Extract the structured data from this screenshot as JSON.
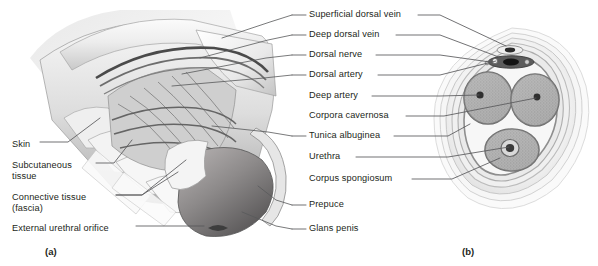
{
  "figure": {
    "type": "anatomical-illustration",
    "style": "grayscale textbook line-and-wash drawing",
    "background_color": "#ffffff",
    "text_color": "#231f20",
    "leader_line_color": "#58595b"
  },
  "panels": [
    {
      "id": "a",
      "caption": "(a)",
      "description": "Cut-away lateral view of the penis shaft with peeled back layers",
      "x": 45,
      "y": 252
    },
    {
      "id": "b",
      "caption": "(b)",
      "description": "Transverse cross-section of the penis shaft",
      "x": 462,
      "y": 252
    }
  ],
  "left_labels": [
    {
      "text": "Skin",
      "x": 12,
      "y": 145,
      "leader": true
    },
    {
      "text": "Subcutaneous",
      "x": 12,
      "y": 166,
      "leader": true
    },
    {
      "text": "tissue",
      "x": 12,
      "y": 177,
      "leader": false
    },
    {
      "text": "Connective tissue",
      "x": 12,
      "y": 198,
      "leader": true
    },
    {
      "text": "(fascia)",
      "x": 12,
      "y": 209,
      "leader": false
    },
    {
      "text": "External urethral orifice",
      "x": 12,
      "y": 229,
      "leader": true
    }
  ],
  "right_labels": [
    {
      "text": "Superficial dorsal vein",
      "y": 15,
      "leader_left": true
    },
    {
      "text": "Deep dorsal vein",
      "y": 35,
      "leader_left": true
    },
    {
      "text": "Dorsal nerve",
      "y": 55,
      "leader_left": true
    },
    {
      "text": "Dorsal artery",
      "y": 75,
      "leader_left": true
    },
    {
      "text": "Deep artery",
      "y": 96,
      "leader_left": false
    },
    {
      "text": "Corpora cavernosa",
      "y": 116,
      "leader_left": false
    },
    {
      "text": "Tunica albuginea",
      "y": 136,
      "leader_left": true
    },
    {
      "text": "Urethra",
      "y": 157,
      "leader_left": false
    },
    {
      "text": "Corpus spongiosum",
      "y": 179,
      "leader_left": false
    },
    {
      "text": "Prepuce",
      "y": 205,
      "leader_left": true
    },
    {
      "text": "Glans penis",
      "y": 229,
      "leader_left": true
    }
  ],
  "cross_section": {
    "center_x": 512,
    "center_y": 120,
    "structures": [
      {
        "name": "corpus-cavernosum-left",
        "cx": 488,
        "cy": 98
      },
      {
        "name": "corpus-cavernosum-right",
        "cx": 535,
        "cy": 100
      },
      {
        "name": "deep-artery-left",
        "cx": 480,
        "cy": 95
      },
      {
        "name": "deep-artery-right",
        "cx": 537,
        "cy": 97
      },
      {
        "name": "corpus-spongiosum",
        "cx": 512,
        "cy": 150
      },
      {
        "name": "urethra",
        "cx": 510,
        "cy": 148
      },
      {
        "name": "dorsal-vessel-bundle",
        "cx": 510,
        "cy": 56
      }
    ]
  }
}
